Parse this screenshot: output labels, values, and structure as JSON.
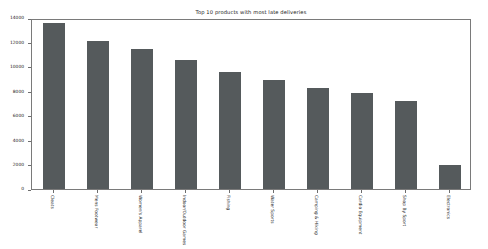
{
  "chart_data": {
    "type": "bar",
    "title": "Top 10 products with most late deliveries",
    "xlabel": "",
    "ylabel": "",
    "grid": false,
    "legend": false,
    "ylim": [
      0,
      14000
    ],
    "yticks": [
      0,
      2000,
      4000,
      6000,
      8000,
      10000,
      12000,
      14000
    ],
    "ytick_labels": [
      "0",
      "2000",
      "4000",
      "6000",
      "8000",
      "10000",
      "12000",
      "14000"
    ],
    "categories": [
      "Cleats",
      "Mens Footwear",
      "Women's Apparel",
      "Indoor/Outdoor Games",
      "Fishing",
      "Water Sports",
      "Camping & Hiking",
      "Cardio Equipment",
      "Shop By Sport",
      "Electronics"
    ],
    "values": [
      13600,
      12100,
      11500,
      10600,
      9600,
      8900,
      8300,
      7900,
      7200,
      2000
    ],
    "bar_color": "#555a5c",
    "frame_color": "#7a7a7a",
    "background_color": "#ffffff"
  }
}
